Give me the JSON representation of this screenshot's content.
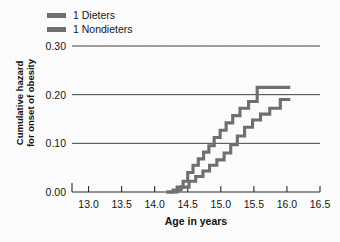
{
  "chart_data": {
    "type": "line",
    "title": "",
    "subtitle": "",
    "xlabel": "Age in years",
    "ylabel": "Cumulative hazard for onset of obesity",
    "ylabel_line1": "Cumulative hazard",
    "ylabel_line2": "for onset of obesity",
    "xlim": [
      12.75,
      16.5
    ],
    "ylim": [
      0.0,
      0.3
    ],
    "xticks": [
      13.0,
      13.5,
      14.0,
      14.5,
      15.0,
      15.5,
      16.0,
      16.5
    ],
    "xticklabels": [
      "13.0",
      "13.5",
      "14.0",
      "14.5",
      "15.0",
      "15.5",
      "16.0",
      "16.5"
    ],
    "yticks": [
      0.0,
      0.1,
      0.2,
      0.3
    ],
    "yticklabels": [
      "0.00",
      "0.10",
      "0.20",
      "0.30"
    ],
    "grid": "horizontal-gridlines-at-y-0.10-0.20-0.30",
    "legend_position": "above-plot-left",
    "step_style": "post",
    "series": [
      {
        "name": "1 Dieters",
        "color": "#6f6f6f",
        "points": [
          {
            "x": 14.18,
            "y": 0.0
          },
          {
            "x": 14.34,
            "y": 0.01
          },
          {
            "x": 14.43,
            "y": 0.022
          },
          {
            "x": 14.5,
            "y": 0.04
          },
          {
            "x": 14.58,
            "y": 0.055
          },
          {
            "x": 14.66,
            "y": 0.068
          },
          {
            "x": 14.74,
            "y": 0.082
          },
          {
            "x": 14.82,
            "y": 0.095
          },
          {
            "x": 14.9,
            "y": 0.112
          },
          {
            "x": 14.99,
            "y": 0.127
          },
          {
            "x": 15.08,
            "y": 0.142
          },
          {
            "x": 15.18,
            "y": 0.157
          },
          {
            "x": 15.29,
            "y": 0.172
          },
          {
            "x": 15.42,
            "y": 0.186
          },
          {
            "x": 15.55,
            "y": 0.215
          },
          {
            "x": 16.05,
            "y": 0.215
          }
        ]
      },
      {
        "name": "1 Nondieters",
        "color": "#6f6f6f",
        "points": [
          {
            "x": 14.18,
            "y": 0.0
          },
          {
            "x": 14.28,
            "y": 0.004
          },
          {
            "x": 14.4,
            "y": 0.01
          },
          {
            "x": 14.52,
            "y": 0.022
          },
          {
            "x": 14.62,
            "y": 0.032
          },
          {
            "x": 14.73,
            "y": 0.043
          },
          {
            "x": 14.83,
            "y": 0.055
          },
          {
            "x": 14.94,
            "y": 0.066
          },
          {
            "x": 15.05,
            "y": 0.08
          },
          {
            "x": 15.15,
            "y": 0.097
          },
          {
            "x": 15.25,
            "y": 0.115
          },
          {
            "x": 15.36,
            "y": 0.133
          },
          {
            "x": 15.48,
            "y": 0.148
          },
          {
            "x": 15.6,
            "y": 0.16
          },
          {
            "x": 15.74,
            "y": 0.172
          },
          {
            "x": 15.9,
            "y": 0.19
          },
          {
            "x": 16.05,
            "y": 0.19
          }
        ]
      }
    ]
  },
  "legend": {
    "items": [
      {
        "label": "1 Dieters"
      },
      {
        "label": "1 Nondieters"
      }
    ]
  }
}
